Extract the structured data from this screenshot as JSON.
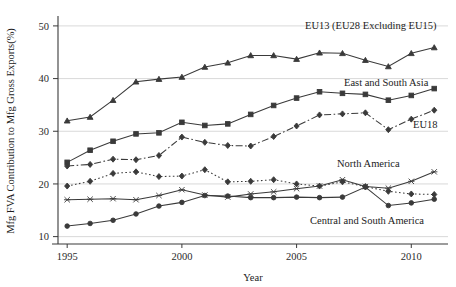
{
  "chart_data": {
    "type": "line",
    "title": "",
    "xlabel": "Year",
    "ylabel": "Mfg FVA Contribution to Mfg Gross Exports(%)",
    "xlim": [
      1994.6,
      2011.6
    ],
    "ylim": [
      8.6,
      51.5
    ],
    "xticks": [
      1995,
      2000,
      2005,
      2010
    ],
    "yticks": [
      10,
      20,
      30,
      40,
      50
    ],
    "grid": true,
    "legend_position": "inline-labels",
    "x": [
      1995,
      1996,
      1997,
      1998,
      1999,
      2000,
      2001,
      2002,
      2003,
      2004,
      2005,
      2006,
      2007,
      2008,
      2009,
      2010,
      2011
    ],
    "series": [
      {
        "name": "EU13 (EU28 Excluding EU15)",
        "label": "EU13 (EU28 Excluding EU15)",
        "marker": "triangle",
        "dash": "solid",
        "values": [
          32.0,
          32.7,
          35.9,
          39.4,
          39.9,
          40.3,
          42.2,
          43.0,
          44.4,
          44.4,
          43.7,
          44.9,
          44.8,
          43.5,
          42.3,
          44.8,
          45.9
        ]
      },
      {
        "name": "East and South Asia",
        "label": "East and South Asia",
        "marker": "square",
        "dash": "solid",
        "values": [
          24.1,
          26.4,
          28.1,
          29.5,
          29.7,
          31.7,
          31.1,
          31.4,
          33.2,
          34.9,
          36.3,
          37.5,
          37.2,
          37.0,
          35.9,
          36.8,
          38.1
        ]
      },
      {
        "name": "EU18",
        "label": "EU18",
        "marker": "diamond",
        "dash": "dashdot",
        "values": [
          23.4,
          23.7,
          24.7,
          24.6,
          25.4,
          28.9,
          27.9,
          27.3,
          27.2,
          29.0,
          31.0,
          33.1,
          33.3,
          33.5,
          30.3,
          32.3,
          34.0
        ]
      },
      {
        "name": "North America",
        "label": "North America",
        "marker": "diamond",
        "dash": "dotted",
        "values": [
          19.6,
          20.5,
          22.0,
          22.3,
          21.4,
          21.5,
          22.7,
          20.4,
          20.5,
          20.8,
          20.0,
          19.6,
          20.4,
          19.5,
          18.6,
          18.1,
          18.0
        ]
      },
      {
        "name": "North America Solid",
        "label": "",
        "marker": "x",
        "dash": "solid",
        "values": [
          17.0,
          17.1,
          17.2,
          17.0,
          17.8,
          18.9,
          17.9,
          17.5,
          18.1,
          18.5,
          19.1,
          19.6,
          20.8,
          19.5,
          19.2,
          20.5,
          22.3
        ]
      },
      {
        "name": "Central and South America",
        "label": "Central and South America",
        "marker": "circle",
        "dash": "solid",
        "values": [
          12.0,
          12.5,
          13.1,
          14.3,
          15.8,
          16.5,
          17.8,
          17.7,
          17.4,
          17.4,
          17.5,
          17.4,
          17.5,
          19.4,
          15.9,
          16.4,
          17.1
        ]
      }
    ],
    "annotations": [
      {
        "text": "EU13 (EU28 Excluding EU15)",
        "x": 305,
        "y": 29
      },
      {
        "text": "East and South Asia",
        "x": 344,
        "y": 86
      },
      {
        "text": "EU18",
        "x": 413,
        "y": 128
      },
      {
        "text": "North America",
        "x": 337,
        "y": 167
      },
      {
        "text": "Central and South America",
        "x": 310,
        "y": 224
      }
    ]
  },
  "axis": {
    "x_tick_labels": [
      "1995",
      "2000",
      "2005",
      "2010"
    ],
    "y_tick_labels": [
      "10",
      "20",
      "30",
      "40",
      "50"
    ],
    "x_title": "Year",
    "y_title": "Mfg FVA Contribution to Mfg Gross Exports(%)"
  }
}
